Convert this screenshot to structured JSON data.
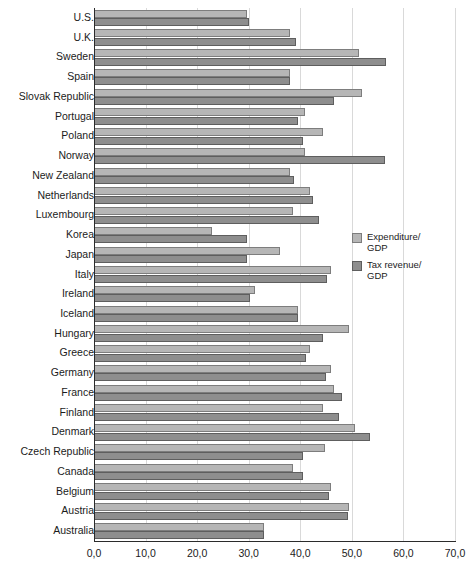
{
  "chart_data": {
    "type": "bar",
    "orientation": "horizontal",
    "title": "",
    "subtitle": "",
    "xlabel": "",
    "ylabel": "",
    "xlim": [
      0.0,
      70.0
    ],
    "xticks": [
      "0,0",
      "10,0",
      "20,0",
      "30,0",
      "40,0",
      "50,0",
      "60,0",
      "70,0"
    ],
    "xtick_values": [
      0,
      10,
      20,
      30,
      40,
      50,
      60,
      70
    ],
    "grid": "vertical",
    "legend_position": "center-right",
    "decimal_separator": ",",
    "categories": [
      "U.S.",
      "U.K.",
      "Sweden",
      "Spain",
      "Slovak Republic",
      "Portugal",
      "Poland",
      "Norway",
      "New Zealand",
      "Netherlands",
      "Luxembourg",
      "Korea",
      "Japan",
      "Italy",
      "Ireland",
      "Iceland",
      "Hungary",
      "Greece",
      "Germany",
      "France",
      "Finland",
      "Denmark",
      "Czech Republic",
      "Canada",
      "Belgium",
      "Austria",
      "Australia"
    ],
    "series": [
      {
        "name": "Expenditure/\nGDP",
        "color": "#b6b6b6",
        "values": [
          29.6,
          38.0,
          51.4,
          38.0,
          52.0,
          41.0,
          44.5,
          41.0,
          38.0,
          41.8,
          38.5,
          22.9,
          36.1,
          46.0,
          31.3,
          39.5,
          49.5,
          41.8,
          46.0,
          46.5,
          44.5,
          50.6,
          44.8,
          38.5,
          46.0,
          49.5,
          33.0
        ]
      },
      {
        "name": "Tax revenue/\nGDP",
        "color": "#8e8e8e",
        "values": [
          30.1,
          39.2,
          56.6,
          38.0,
          46.5,
          39.5,
          40.5,
          56.5,
          38.8,
          42.5,
          43.7,
          29.6,
          29.6,
          45.2,
          30.2,
          39.5,
          44.5,
          41.2,
          45.0,
          48.0,
          47.5,
          53.5,
          40.5,
          40.5,
          45.5,
          49.3,
          33.0
        ]
      }
    ]
  },
  "legend": {
    "items": [
      {
        "label": "Expenditure/\nGDP"
      },
      {
        "label": "Tax revenue/\nGDP"
      }
    ]
  }
}
